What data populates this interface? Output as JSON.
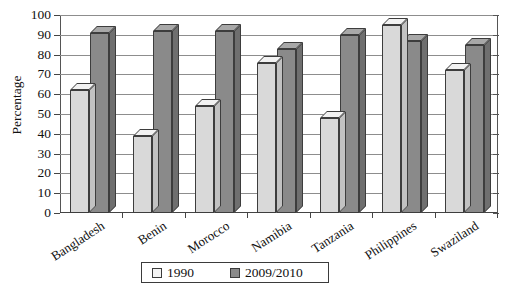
{
  "chart_data": {
    "type": "bar",
    "title": "",
    "xlabel": "",
    "ylabel": "Percentage",
    "ylim": [
      0,
      100
    ],
    "ytick_step": 10,
    "yticks": [
      0,
      10,
      20,
      30,
      40,
      50,
      60,
      70,
      80,
      90,
      100
    ],
    "grid": "horizontal",
    "legend_position": "bottom-center",
    "style": "3d-clustered-column",
    "categories": [
      "Bangladesh",
      "Benin",
      "Morocco",
      "Namibia",
      "Tanzania",
      "Philippines",
      "Swaziland"
    ],
    "series": [
      {
        "name": "1990",
        "color": "#d9d9d9",
        "values": [
          62,
          39,
          54,
          76,
          48,
          95,
          72
        ]
      },
      {
        "name": "2009/2010",
        "color": "#8a8a8a",
        "values": [
          91,
          92,
          92,
          83,
          90,
          87,
          85
        ]
      }
    ]
  },
  "legend": {
    "items": [
      {
        "label": "1990"
      },
      {
        "label": "2009/2010"
      }
    ]
  },
  "axis": {
    "y_title": "Percentage"
  },
  "title_sliver": "",
  "colors": {
    "series_1990_front": "#d9d9d9",
    "series_2009_front": "#8a8a8a",
    "gridline": "#8d8d8d",
    "axis": "#444444",
    "text": "#111111"
  }
}
